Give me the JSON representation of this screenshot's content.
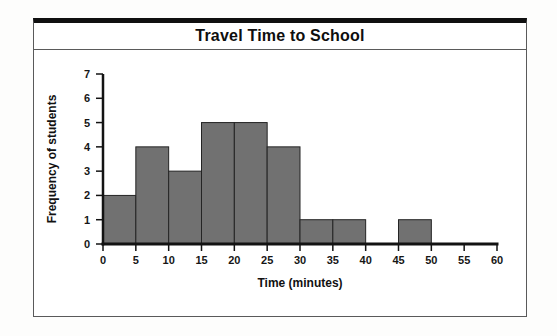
{
  "title": "Travel Time to School",
  "frame": {
    "border_color": "#5a5a5a",
    "top_rule_color": "#101010",
    "background": "#ffffff"
  },
  "chart_data": {
    "type": "bar",
    "subtype": "histogram",
    "title": "Travel Time to School",
    "xlabel": "Time (minutes)",
    "ylabel": "Frequency of students",
    "bin_width": 5,
    "bin_edges": [
      0,
      5,
      10,
      15,
      20,
      25,
      30,
      35,
      40,
      45,
      50,
      55,
      60
    ],
    "categories": [
      "0-5",
      "5-10",
      "10-15",
      "15-20",
      "20-25",
      "25-30",
      "30-35",
      "35-40",
      "40-45",
      "45-50",
      "50-55",
      "55-60"
    ],
    "values": [
      2,
      4,
      3,
      5,
      5,
      4,
      1,
      1,
      0,
      1,
      0,
      0
    ],
    "x_ticks": [
      0,
      5,
      10,
      15,
      20,
      25,
      30,
      35,
      40,
      45,
      50,
      55,
      60
    ],
    "y_ticks": [
      0,
      1,
      2,
      3,
      4,
      5,
      6,
      7
    ],
    "xlim": [
      0,
      60
    ],
    "ylim": [
      0,
      7
    ],
    "grid": false,
    "legend": "none",
    "bar_color": "#717171",
    "bar_border_color": "#242424",
    "axis_color": "#131313",
    "text_color": "#161616"
  }
}
